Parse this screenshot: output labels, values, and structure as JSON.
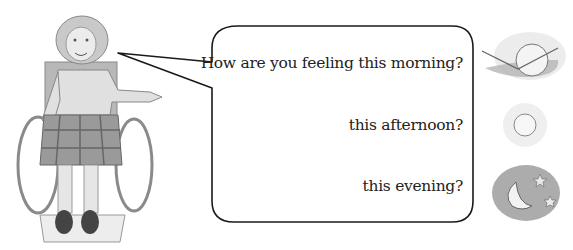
{
  "speech_bubble": {
    "lines": [
      {
        "text": "How are you feeling this morning?"
      },
      {
        "text": "this afternoon?"
      },
      {
        "text": "this evening?"
      }
    ]
  },
  "icons": [
    {
      "name": "sunrise-icon",
      "meaning": "morning"
    },
    {
      "name": "sun-icon",
      "meaning": "afternoon"
    },
    {
      "name": "moon-stars-icon",
      "meaning": "evening"
    }
  ],
  "illustration": {
    "subject": "woman in wheelchair pointing"
  },
  "colors": {
    "outline": "#1a1a1a",
    "text": "#222222",
    "shade": "#b5b5b5"
  }
}
